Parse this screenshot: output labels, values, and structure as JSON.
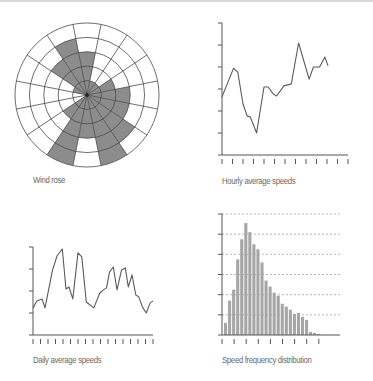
{
  "colors": {
    "axis": "#555555",
    "line": "#5a5a5a",
    "fill": "#8c8c8c",
    "bar": "#a6a6a6",
    "grid": "#9a9a9a",
    "caption": "#6a6a6a"
  },
  "captions": {
    "wind_rose": "Wind rose",
    "hourly": "Hourly average speeds",
    "daily": "Daily average speeds",
    "frequency": "Speed frequency distribution"
  },
  "chart_data": [
    {
      "type": "polar-bar",
      "title": "Wind rose",
      "sectors": 16,
      "rings": 5,
      "directions": [
        "N",
        "NNE",
        "NE",
        "ENE",
        "E",
        "ESE",
        "SE",
        "SSE",
        "S",
        "SSW",
        "SW",
        "WSW",
        "W",
        "WNW",
        "NW",
        "NNW"
      ],
      "values": [
        3,
        1,
        1,
        2,
        3,
        3,
        4,
        5,
        3,
        5,
        2,
        0,
        0,
        1,
        3,
        4
      ],
      "grid": true
    },
    {
      "type": "line",
      "title": "Hourly average speeds",
      "xlabel": "",
      "ylabel": "",
      "x": [
        0,
        1.1,
        1.5,
        2.0,
        2.4,
        2.7,
        3.3,
        4.0,
        4.4,
        4.9,
        5.2,
        5.9,
        6.6,
        7.3,
        8.3,
        8.7,
        9.3,
        9.8,
        10.1
      ],
      "values": [
        2.64,
        3.95,
        3.77,
        2.32,
        1.77,
        1.73,
        1.0,
        3.09,
        3.09,
        2.77,
        2.68,
        3.14,
        3.23,
        5.09,
        3.45,
        4.0,
        4.0,
        4.45,
        4.05
      ],
      "xlim": [
        0,
        12
      ],
      "ylim": [
        0,
        6
      ],
      "x_ticks": 13,
      "y_ticks": 7,
      "tick_labels": "none",
      "grid": false
    },
    {
      "type": "line",
      "title": "Daily average speeds",
      "xlabel": "",
      "ylabel": "",
      "x": [
        0,
        0.5,
        1.2,
        1.6,
        2.6,
        3.2,
        3.9,
        4.4,
        4.8,
        5.3,
        6.0,
        6.5,
        7.1,
        8.1,
        8.9,
        9.4,
        9.8,
        10.2,
        10.7,
        11.2,
        11.8,
        12.3,
        12.7,
        13.2,
        13.7,
        14.1,
        14.6,
        15.1,
        15.6,
        16.0
      ],
      "values": [
        1.23,
        1.55,
        1.64,
        1.23,
        2.95,
        3.59,
        3.91,
        2.09,
        2.18,
        1.64,
        3.73,
        3.55,
        1.5,
        1.23,
        1.91,
        2.05,
        2.14,
        2.86,
        3.09,
        2.05,
        2.95,
        3.05,
        2.18,
        2.73,
        1.82,
        1.73,
        1.27,
        1.0,
        1.45,
        1.55
      ],
      "xlim": [
        0,
        16
      ],
      "ylim": [
        0,
        4
      ],
      "x_ticks": 17,
      "y_ticks": 5,
      "tick_labels": "none",
      "grid": false
    },
    {
      "type": "bar",
      "title": "Speed frequency distribution",
      "xlabel": "",
      "ylabel": "",
      "categories": [
        "1",
        "2",
        "3",
        "4",
        "5",
        "6",
        "7",
        "8",
        "9",
        "10",
        "11",
        "12",
        "13",
        "14",
        "15",
        "16",
        "17",
        "18",
        "19",
        "20",
        "21",
        "22",
        "23",
        "24"
      ],
      "values": [
        0.6,
        1.7,
        2.25,
        3.75,
        4.75,
        5.55,
        5.1,
        4.5,
        4.25,
        3.6,
        2.7,
        2.4,
        2.1,
        1.95,
        1.55,
        1.4,
        1.25,
        1.05,
        1.1,
        0.9,
        0.75,
        0.15,
        0.1,
        0.05
      ],
      "ylim": [
        0,
        6
      ],
      "x_ticks": 9,
      "y_ticks": 7,
      "tick_labels": "none",
      "grid": "horizontal-dashed"
    }
  ]
}
